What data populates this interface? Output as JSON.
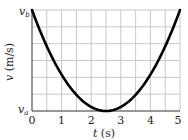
{
  "chart_data": {
    "type": "line",
    "title": "",
    "xlabel": "t (s)",
    "ylabel": "v (m/s)",
    "xlim": [
      0,
      5
    ],
    "ylim_labels": [
      "v_a",
      "v_b"
    ],
    "x_ticks": [
      "0",
      "1",
      "2",
      "3",
      "4",
      "5"
    ],
    "y_tick_labels": {
      "bottom": "v_a",
      "top": "v_b"
    },
    "grid": true,
    "grid_x_step": 0.5,
    "grid_y_divisions": 6,
    "series": [
      {
        "name": "v(t)",
        "shape": "parabola",
        "x": [
          0,
          0.5,
          1,
          1.5,
          2,
          2.5,
          3,
          3.5,
          4,
          4.5,
          5
        ],
        "values_normalized": [
          1.0,
          0.64,
          0.36,
          0.16,
          0.04,
          0.0,
          0.04,
          0.16,
          0.36,
          0.64,
          1.0
        ],
        "note": "v = v_a at t = 2.5 s (minimum), v = v_b at t = 0 and t = 5 s"
      }
    ],
    "legend": null
  },
  "axes": {
    "x_label_var": "t",
    "x_label_unit": " (s)",
    "y_label_var": "v",
    "y_label_unit": " (m/s)",
    "y_top_var": "v",
    "y_top_sub": "b",
    "y_bottom_var": "v",
    "y_bottom_sub": "a",
    "x_tick_0": "0",
    "x_tick_1": "1",
    "x_tick_2": "2",
    "x_tick_3": "3",
    "x_tick_4": "4",
    "x_tick_5": "5"
  },
  "colors": {
    "curve": "#000000",
    "grid": "#c8c8c8",
    "axis": "#333333"
  }
}
